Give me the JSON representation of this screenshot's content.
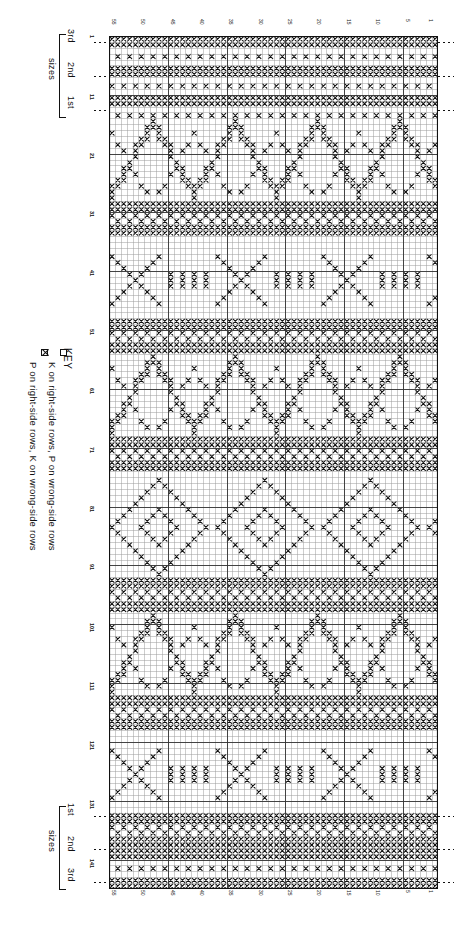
{
  "chart_data": {
    "type": "heatmap",
    "grid": {
      "columns": 56,
      "rows": 145,
      "cell_px": 5.85
    },
    "legend_position": "left",
    "symbols": [
      {
        "code": "K",
        "glyph": "empty-box",
        "label": "K on right-side rows, P on wrong-side rows"
      },
      {
        "code": "P",
        "glyph": "crossed-box",
        "label": "P on right-side rows, K on wrong-side rows"
      }
    ],
    "column_ticks": [
      1,
      5,
      10,
      15,
      20,
      25,
      30,
      35,
      40,
      45,
      50,
      55
    ],
    "row_ticks": [
      1,
      11,
      21,
      31,
      41,
      51,
      61,
      71,
      81,
      91,
      101,
      111,
      121,
      131,
      141
    ],
    "bands": [
      {
        "name": "border-texture-top",
        "rows": [
          1,
          14
        ],
        "fill": "textured"
      },
      {
        "name": "chevron-large-1",
        "rows": [
          15,
          28
        ],
        "fill": "zigzag"
      },
      {
        "name": "band-solid-1",
        "rows": [
          29,
          34
        ],
        "fill": "solid-band"
      },
      {
        "name": "arrow-motif-1",
        "rows": [
          35,
          48
        ],
        "fill": "arrows"
      },
      {
        "name": "band-solid-2",
        "rows": [
          49,
          54
        ],
        "fill": "solid-band"
      },
      {
        "name": "chevron-large-2",
        "rows": [
          55,
          68
        ],
        "fill": "zigzag"
      },
      {
        "name": "band-solid-3",
        "rows": [
          69,
          74
        ],
        "fill": "solid-band"
      },
      {
        "name": "diamond-motif",
        "rows": [
          75,
          92
        ],
        "fill": "diamonds"
      },
      {
        "name": "band-solid-4",
        "rows": [
          93,
          98
        ],
        "fill": "solid-band"
      },
      {
        "name": "chevron-large-3",
        "rows": [
          99,
          112
        ],
        "fill": "zigzag"
      },
      {
        "name": "band-solid-5",
        "rows": [
          113,
          118
        ],
        "fill": "solid-band"
      },
      {
        "name": "arrow-motif-2",
        "rows": [
          119,
          132
        ],
        "fill": "arrows"
      },
      {
        "name": "band-solid-6",
        "rows": [
          133,
          138
        ],
        "fill": "solid-band"
      },
      {
        "name": "border-texture-bottom",
        "rows": [
          139,
          145
        ],
        "fill": "textured"
      }
    ],
    "xlabel": "stitches",
    "ylabel": "rows"
  },
  "key": {
    "title": "KEY",
    "items": [
      {
        "symbol": "empty-box",
        "text": "K on right-side rows, P on wrong-side rows"
      },
      {
        "symbol": "crossed-box",
        "text": "P on right-side rows, K on wrong-side rows"
      }
    ]
  },
  "sizes_top": {
    "label": "sizes",
    "items": [
      {
        "name": "3rd"
      },
      {
        "name": "2nd"
      },
      {
        "name": "1st"
      }
    ]
  },
  "sizes_bottom": {
    "label": "sizes",
    "items": [
      {
        "name": "1st"
      },
      {
        "name": "2nd"
      },
      {
        "name": "3rd"
      }
    ]
  },
  "colors": {
    "ink": "#111111",
    "paper": "#ffffff",
    "grid_light": "#9a9a9a",
    "grid_heavy": "#333333"
  }
}
